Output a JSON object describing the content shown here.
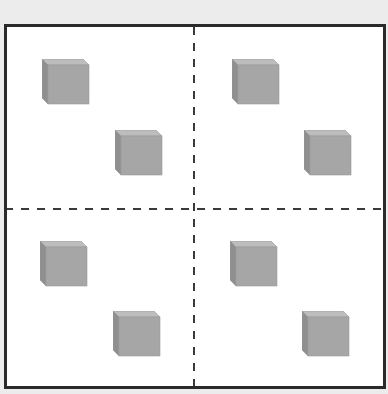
{
  "diagram": {
    "colors": {
      "background": "#ececec",
      "frame_fill": "#ffffff",
      "frame_border": "#2a2a2a",
      "divider": "#3a3a3a",
      "cube_top": "#bdbdbd",
      "cube_front": "#a6a6a6",
      "cube_side": "#8f8f8f",
      "cube_edge": "#9a9a9a"
    },
    "quadrants": [
      {
        "name": "top-left",
        "cubes": [
          {
            "x": 42,
            "y": 59
          },
          {
            "x": 115,
            "y": 130
          }
        ]
      },
      {
        "name": "top-right",
        "cubes": [
          {
            "x": 232,
            "y": 59
          },
          {
            "x": 304,
            "y": 130
          }
        ]
      },
      {
        "name": "bottom-left",
        "cubes": [
          {
            "x": 40,
            "y": 241
          },
          {
            "x": 113,
            "y": 311
          }
        ]
      },
      {
        "name": "bottom-right",
        "cubes": [
          {
            "x": 230,
            "y": 241
          },
          {
            "x": 302,
            "y": 311
          }
        ]
      }
    ],
    "cube_count": 8
  }
}
